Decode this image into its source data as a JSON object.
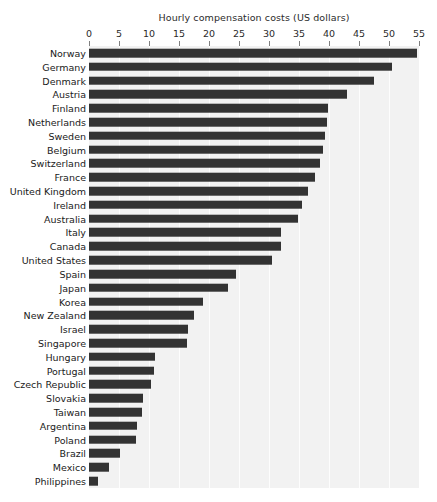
{
  "chart_data": {
    "type": "bar",
    "orientation": "horizontal",
    "title": "Hourly compensation costs (US dollars)",
    "xlabel": "",
    "ylabel": "",
    "xlim": [
      0,
      55
    ],
    "xticks": [
      0,
      5,
      10,
      15,
      20,
      25,
      30,
      35,
      40,
      45,
      50,
      55
    ],
    "grid": true,
    "legend": null,
    "background_color": "#f2f2f2",
    "bar_color": "#333333",
    "gridline_color": "#ffffff",
    "categories": [
      "Norway",
      "Germany",
      "Denmark",
      "Austria",
      "Finland",
      "Netherlands",
      "Sweden",
      "Belgium",
      "Switzerland",
      "France",
      "United Kingdom",
      "Ireland",
      "Australia",
      "Italy",
      "Canada",
      "United States",
      "Spain",
      "Japan",
      "Korea",
      "New Zealand",
      "Israel",
      "Singapore",
      "Hungary",
      "Portugal",
      "Czech Republic",
      "Slovakia",
      "Taiwan",
      "Argentina",
      "Poland",
      "Brazil",
      "Mexico",
      "Philippines"
    ],
    "values": [
      54.7,
      50.5,
      47.5,
      43.0,
      39.8,
      39.7,
      39.3,
      39.0,
      38.5,
      37.7,
      36.5,
      35.5,
      34.8,
      32.0,
      32.0,
      30.5,
      24.5,
      23.2,
      19.0,
      17.5,
      16.5,
      16.3,
      11.0,
      10.8,
      10.3,
      9.0,
      8.8,
      8.0,
      7.8,
      5.1,
      3.3,
      1.5
    ]
  }
}
